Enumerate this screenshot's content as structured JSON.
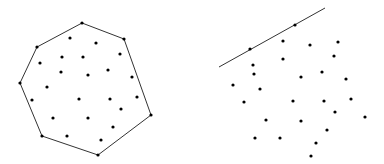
{
  "figure": {
    "left_panel": {
      "hull_vertices": [
        [
          82,
          23
        ],
        [
          124,
          39
        ],
        [
          151,
          115
        ],
        [
          98,
          155
        ],
        [
          42,
          136
        ],
        [
          20,
          83
        ],
        [
          37,
          47
        ]
      ],
      "interior_points": [
        [
          70,
          38
        ],
        [
          96,
          43
        ],
        [
          120,
          54
        ],
        [
          40,
          63
        ],
        [
          62,
          57
        ],
        [
          83,
          57
        ],
        [
          61,
          72
        ],
        [
          88,
          75
        ],
        [
          108,
          70
        ],
        [
          132,
          77
        ],
        [
          47,
          87
        ],
        [
          32,
          100
        ],
        [
          79,
          99
        ],
        [
          110,
          99
        ],
        [
          137,
          97
        ],
        [
          121,
          109
        ],
        [
          53,
          118
        ],
        [
          88,
          118
        ],
        [
          113,
          127
        ],
        [
          67,
          136
        ],
        [
          101,
          140
        ]
      ]
    },
    "right_panel": {
      "line": [
        [
          219,
          67
        ],
        [
          325,
          8
        ]
      ],
      "points_on_line": [
        [
          250,
          49
        ],
        [
          295,
          25
        ]
      ],
      "points": [
        [
          283,
          41
        ],
        [
          310,
          45
        ],
        [
          338,
          42
        ],
        [
          253,
          65
        ],
        [
          283,
          59
        ],
        [
          334,
          56
        ],
        [
          254,
          74
        ],
        [
          301,
          77
        ],
        [
          322,
          72
        ],
        [
          346,
          79
        ],
        [
          233,
          85
        ],
        [
          260,
          89
        ],
        [
          244,
          102
        ],
        [
          293,
          101
        ],
        [
          324,
          101
        ],
        [
          351,
          99
        ],
        [
          335,
          112
        ],
        [
          365,
          117
        ],
        [
          266,
          120
        ],
        [
          301,
          121
        ],
        [
          327,
          130
        ],
        [
          255,
          138
        ],
        [
          280,
          138
        ],
        [
          316,
          143
        ],
        [
          311,
          156
        ]
      ]
    },
    "colors": {
      "stroke": "#333333",
      "point": "#000000",
      "background": "#ffffff"
    }
  }
}
